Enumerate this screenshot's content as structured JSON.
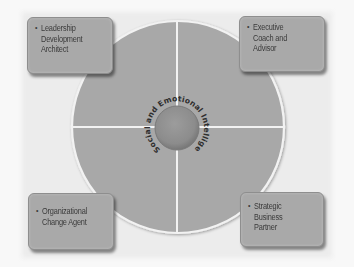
{
  "diagram": {
    "center_label": "Social and Emotional Intelligence",
    "roles": [
      {
        "id": "top-left",
        "label": "Leadership\nDevelopment\nArchitect"
      },
      {
        "id": "top-right",
        "label": "Executive\nCoach and\nAdvisor"
      },
      {
        "id": "bottom-left",
        "label": "Organizational\nChange Agent"
      },
      {
        "id": "bottom-right",
        "label": "Strategic\nBusiness\nPartner"
      }
    ],
    "bullet_icon": "•",
    "colors": {
      "background": "#f8f8f8",
      "outer_circle": "#a8a8a8",
      "outer_circle_border": "#f2f2f2",
      "divider_lines": "#f2f2f2",
      "inner_circle": "#8f8f8f",
      "box_fill": "#a9a9a9",
      "text": "#3a3a3a"
    }
  }
}
